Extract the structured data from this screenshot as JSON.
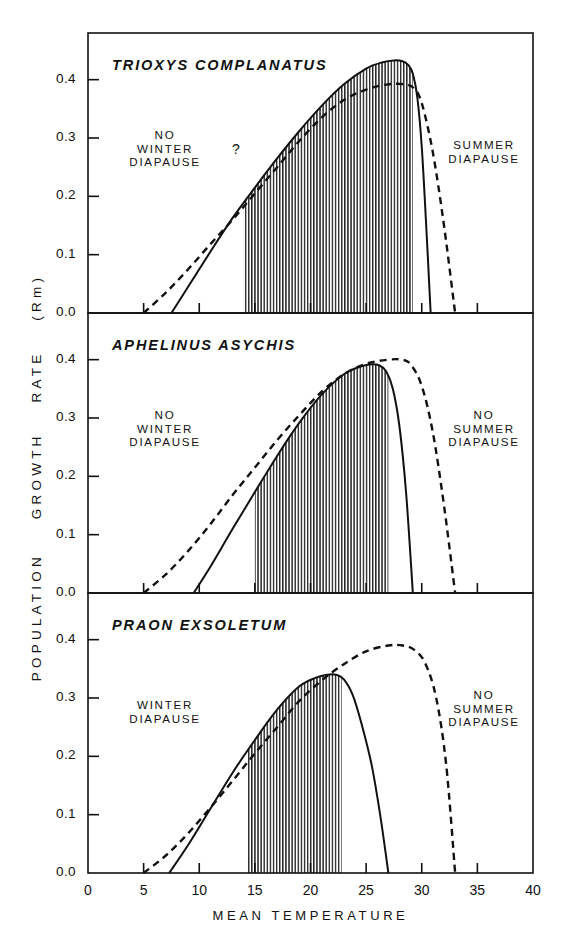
{
  "axes": {
    "ylabel": "POPULATION GROWTH RATE (Rm)",
    "ylabel_parts": [
      "POPULATION",
      "GROWTH",
      "RATE",
      "(Rm)"
    ],
    "xlabel": "MEAN TEMPERATURE",
    "yticks": [
      "0.0",
      "0.1",
      "0.2",
      "0.3",
      "0.4"
    ],
    "xticks": [
      "0",
      "5",
      "10",
      "15",
      "20",
      "25",
      "30",
      "35",
      "40"
    ]
  },
  "panels": [
    {
      "species": "TRIOXYS COMPLANATUS",
      "left_annotation": "NO\nWINTER\nDIAPAUSE",
      "left_annotation_lines": [
        "NO",
        "WINTER",
        "DIAPAUSE"
      ],
      "question_mark": "?",
      "right_annotation": "SUMMER\nDIAPAUSE",
      "right_annotation_lines": [
        "SUMMER",
        "DIAPAUSE"
      ]
    },
    {
      "species": "APHELINUS ASYCHIS",
      "left_annotation": "NO\nWINTER\nDIAPAUSE",
      "left_annotation_lines": [
        "NO",
        "WINTER",
        "DIAPAUSE"
      ],
      "question_mark": "",
      "right_annotation": "NO\nSUMMER\nDIAPAUSE",
      "right_annotation_lines": [
        "NO",
        "SUMMER",
        "DIAPAUSE"
      ]
    },
    {
      "species": "PRAON EXSOLETUM",
      "left_annotation": "WINTER\nDIAPAUSE",
      "left_annotation_lines": [
        "WINTER",
        "DIAPAUSE"
      ],
      "question_mark": "",
      "right_annotation": "NO\nSUMMER\nDIAPAUSE",
      "right_annotation_lines": [
        "NO",
        "SUMMER",
        "DIAPAUSE"
      ]
    }
  ],
  "chart_data": {
    "type": "line",
    "title": "",
    "xlabel": "MEAN TEMPERATURE",
    "ylabel": "POPULATION GROWTH RATE (Rm)",
    "xlim": [
      0,
      40
    ],
    "ylim": [
      0.0,
      0.48
    ],
    "grid": false,
    "legend": "none",
    "panels": [
      {
        "name": "TRIOXYS COMPLANATUS",
        "shaded_range": [
          14.0,
          29.2
        ],
        "series": [
          {
            "name": "solid",
            "style": "solid",
            "x": [
              7.5,
              9,
              11,
              13,
              15,
              17,
              19,
              21,
              23,
              25,
              26.5,
              27.5,
              28.2,
              28.8,
              29.2,
              29.6,
              30.0,
              30.4,
              30.8
            ],
            "y": [
              0.0,
              0.045,
              0.105,
              0.163,
              0.215,
              0.265,
              0.312,
              0.355,
              0.392,
              0.419,
              0.43,
              0.433,
              0.432,
              0.425,
              0.41,
              0.37,
              0.285,
              0.15,
              0.0
            ]
          },
          {
            "name": "dashed",
            "style": "dashed",
            "x": [
              5.0,
              7,
              9,
              11,
              13,
              15,
              17,
              19,
              21,
              23,
              25,
              27,
              28.5,
              29.3,
              30,
              31,
              32,
              33
            ],
            "y": [
              0.0,
              0.035,
              0.075,
              0.118,
              0.16,
              0.205,
              0.25,
              0.295,
              0.335,
              0.365,
              0.383,
              0.392,
              0.392,
              0.385,
              0.36,
              0.275,
              0.15,
              0.0
            ]
          }
        ]
      },
      {
        "name": "APHELINUS ASYCHIS",
        "shaded_range": [
          15.0,
          27.0
        ],
        "series": [
          {
            "name": "solid",
            "style": "solid",
            "x": [
              9.5,
              11,
              13,
              15,
              17,
              19,
              21,
              23,
              24.5,
              25.5,
              26.2,
              26.8,
              27.4,
              28,
              28.6,
              29.2
            ],
            "y": [
              0.0,
              0.045,
              0.11,
              0.173,
              0.235,
              0.292,
              0.34,
              0.375,
              0.388,
              0.392,
              0.39,
              0.38,
              0.35,
              0.285,
              0.17,
              0.0
            ]
          },
          {
            "name": "dashed",
            "style": "dashed",
            "x": [
              5.0,
              7,
              9,
              11,
              13,
              15,
              17,
              19,
              21,
              23,
              25,
              27,
              28.2,
              29,
              30,
              31,
              32,
              33
            ],
            "y": [
              0.0,
              0.032,
              0.072,
              0.118,
              0.168,
              0.215,
              0.262,
              0.305,
              0.345,
              0.375,
              0.393,
              0.4,
              0.4,
              0.392,
              0.355,
              0.275,
              0.15,
              0.0
            ]
          }
        ]
      },
      {
        "name": "PRAON EXSOLETUM",
        "shaded_range": [
          14.3,
          22.8
        ],
        "series": [
          {
            "name": "solid",
            "style": "solid",
            "x": [
              7.3,
              9,
              11,
              13,
              15,
              17,
              19,
              20.5,
              21.5,
              22.3,
              23.0,
              23.8,
              24.6,
              25.5,
              26.3,
              27.0
            ],
            "y": [
              0.0,
              0.048,
              0.11,
              0.172,
              0.228,
              0.28,
              0.32,
              0.335,
              0.34,
              0.34,
              0.332,
              0.305,
              0.255,
              0.185,
              0.095,
              0.0
            ]
          },
          {
            "name": "dashed",
            "style": "dashed",
            "x": [
              5.0,
              7,
              9,
              11,
              13,
              15,
              17,
              19,
              21,
              23,
              25,
              27,
              28.3,
              29.3,
              30.3,
              31.3,
              32.2,
              33.0
            ],
            "y": [
              0.0,
              0.03,
              0.068,
              0.112,
              0.158,
              0.205,
              0.25,
              0.295,
              0.33,
              0.358,
              0.38,
              0.39,
              0.39,
              0.383,
              0.36,
              0.3,
              0.185,
              0.0
            ]
          }
        ]
      }
    ]
  }
}
